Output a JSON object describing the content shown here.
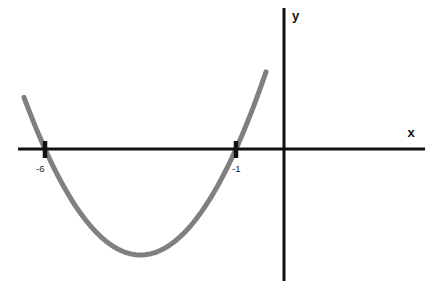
{
  "figure": {
    "background_color": "#ffffff",
    "axis_color": "#111111",
    "curve_color": "#808080",
    "tick_color": "#111111",
    "width": 439,
    "height": 290
  },
  "axes": {
    "x_label": "x",
    "y_label": "y",
    "x_axis": {
      "x1": 18,
      "x2": 425,
      "y": 149,
      "thickness": 3
    },
    "y_axis": {
      "y1": 8,
      "y2": 281,
      "x": 284,
      "thickness": 3
    },
    "x_label_pos": {
      "x": 411,
      "y": 137
    },
    "y_label_pos": {
      "x": 292,
      "y": 20
    }
  },
  "ticks": [
    {
      "label": "-6",
      "x_pixel": 45,
      "label_x": 36,
      "label_y": 172
    },
    {
      "label": "-1",
      "x_pixel": 236,
      "label_x": 232,
      "label_y": 172
    }
  ],
  "chart_data": {
    "type": "line",
    "title": "",
    "subtitle": "",
    "xlabel": "x",
    "ylabel": "y",
    "grid": false,
    "legend": null,
    "curve": {
      "name": "parabola",
      "shape": "upward-opening parabola",
      "equation": "y = a(x + 6)(x + 1)",
      "roots": [
        -6,
        -1
      ],
      "vertex": {
        "x": -3.5,
        "y_sign": "negative"
      },
      "color": "#808080",
      "stroke_width": 5,
      "opens": "up"
    },
    "annotations": [
      {
        "text": "-6",
        "type": "x-intercept-label",
        "value": -6
      },
      {
        "text": "-1",
        "type": "x-intercept-label",
        "value": -1
      }
    ],
    "pixel_path": {
      "left_end": {
        "x": 24,
        "y": 73
      },
      "left_root": {
        "x": 45,
        "y": 149
      },
      "vertex": {
        "x": 147,
        "y": 255
      },
      "right_root": {
        "x": 236,
        "y": 149
      },
      "right_end": {
        "x": 266,
        "y": 73
      }
    },
    "axis_origin_pixel": {
      "x": 284,
      "y": 149
    }
  }
}
